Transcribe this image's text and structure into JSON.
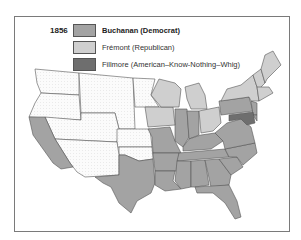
{
  "legend": {
    "year": "1856",
    "items": [
      {
        "label": "Buchanan (Democrat)",
        "color": "#a3a3a3",
        "bold": true
      },
      {
        "label": "Frémont (Republican)",
        "color": "#cfcfcf",
        "bold": false
      },
      {
        "label": "Fillmore (American–Know-Nothing–Whig)",
        "color": "#6e6e6e",
        "bold": false
      }
    ],
    "territory_pattern": "dotted white (territories, no vote)"
  },
  "map": {
    "title": "Presidential Election of 1856",
    "colors": {
      "democrat": "#a3a3a3",
      "republican": "#cfcfcf",
      "american": "#6e6e6e",
      "territory": "#f7f7f7",
      "border": "#555555"
    },
    "regions": {
      "democrat": [
        "California",
        "Texas",
        "Missouri",
        "Illinois",
        "Indiana",
        "Kentucky",
        "Tennessee",
        "Arkansas",
        "Louisiana",
        "Mississippi",
        "Alabama",
        "Georgia",
        "Florida",
        "South Carolina",
        "North Carolina",
        "Virginia",
        "Pennsylvania",
        "New Jersey",
        "Delaware"
      ],
      "republican": [
        "Iowa",
        "Wisconsin",
        "Michigan",
        "Ohio",
        "New York",
        "Vermont",
        "New Hampshire",
        "Maine",
        "Massachusetts",
        "Connecticut",
        "Rhode Island"
      ],
      "american": [
        "Maryland"
      ],
      "territories": [
        "Washington Territory",
        "Oregon",
        "Utah Territory",
        "New Mexico Territory",
        "Nebraska Territory",
        "Kansas Territory",
        "Minnesota",
        "Unorganized Territory"
      ]
    }
  }
}
